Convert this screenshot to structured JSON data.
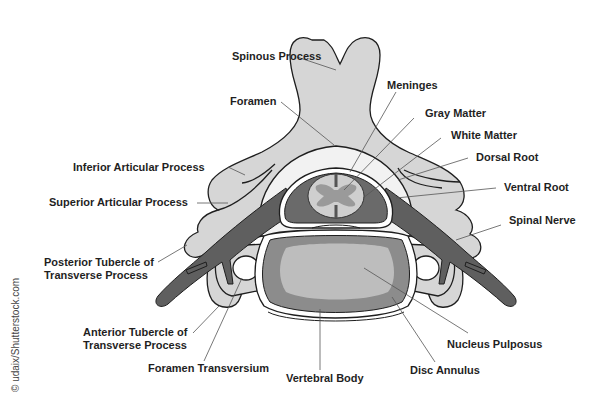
{
  "diagram": {
    "credit": "© udaix/Shutterstock.com",
    "colors": {
      "bone": "#d6d6d6",
      "outline": "#1e1e1e",
      "nerve": "#5f5f5f",
      "foramen": "#f2f2f2",
      "gray_matter": "#9a9a9a",
      "white_matter": "#cfcfcf",
      "disc_annulus": "#8c8c8c",
      "nucleus_pulposus": "#bdbdbd",
      "leader_line": "#555555"
    },
    "labels": {
      "spinous_process": "Spinous Process",
      "foramen": "Foramen",
      "meninges": "Meninges",
      "gray_matter": "Gray Matter",
      "white_matter": "White Matter",
      "dorsal_root": "Dorsal Root",
      "ventral_root": "Ventral Root",
      "spinal_nerve": "Spinal Nerve",
      "inferior_articular_process": "Inferior Articular Process",
      "superior_articular_process": "Superior Articular Process",
      "posterior_tubercle_line1": "Posterior Tubercle of",
      "posterior_tubercle_line2": "Transverse Process",
      "anterior_tubercle_line1": "Anterior Tubercle of",
      "anterior_tubercle_line2": "Transverse Process",
      "foramen_transversium": "Foramen Transversium",
      "vertebral_body": "Vertebral Body",
      "disc_annulus": "Disc Annulus",
      "nucleus_pulposus": "Nucleus Pulposus"
    }
  }
}
